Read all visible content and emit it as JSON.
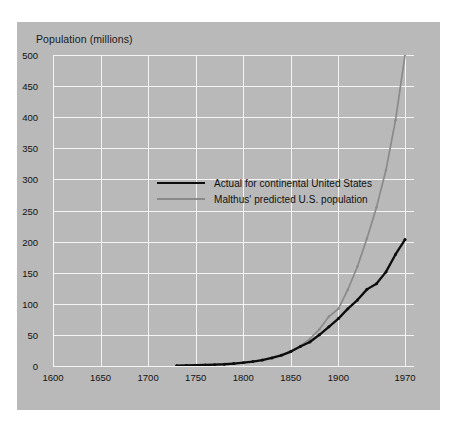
{
  "figure": {
    "y_axis_title": "Population (millions)",
    "background_color": "#b9b9b9",
    "grid_color": "#f4f4f4"
  },
  "legend": {
    "position": "inside-top-left",
    "entries": [
      {
        "label": "Actual for continental United States",
        "color": "#0d0d0d",
        "key": "actual"
      },
      {
        "label": "Malthus' predicted U.S. population",
        "color": "#8a8a8a",
        "key": "malthus"
      }
    ]
  },
  "axes": {
    "y_ticks": [
      "500",
      "450",
      "400",
      "350",
      "300",
      "250",
      "200",
      "150",
      "100",
      "50",
      "0"
    ],
    "x_ticks": [
      "1600",
      "1650",
      "1700",
      "1750",
      "1800",
      "1850",
      "1900",
      "1970"
    ]
  },
  "chart_data": {
    "type": "line",
    "title": "",
    "xlabel": "",
    "ylabel": "Population (millions)",
    "xlim": [
      1600,
      1970
    ],
    "ylim": [
      0,
      500
    ],
    "ytick_values": [
      0,
      50,
      100,
      150,
      200,
      250,
      300,
      350,
      400,
      450,
      500
    ],
    "xtick_values": [
      1600,
      1650,
      1700,
      1750,
      1800,
      1850,
      1900,
      1970
    ],
    "grid": true,
    "legend_position": "inside-top-left",
    "series": [
      {
        "name": "Actual for continental United States",
        "color": "#0d0d0d",
        "markers": true,
        "x": [
          1730,
          1740,
          1750,
          1760,
          1770,
          1780,
          1790,
          1800,
          1810,
          1820,
          1830,
          1840,
          1850,
          1860,
          1870,
          1880,
          1890,
          1900,
          1910,
          1920,
          1930,
          1940,
          1950,
          1960,
          1970
        ],
        "y": [
          0.6,
          0.9,
          1.2,
          1.6,
          2.1,
          2.8,
          3.9,
          5.3,
          7.2,
          9.6,
          12.9,
          17.1,
          23.2,
          31.4,
          38.6,
          50.2,
          63.0,
          76.2,
          92.2,
          106.0,
          123.2,
          132.2,
          151.3,
          179.3,
          203.2
        ]
      },
      {
        "name": "Malthus' predicted U.S. population",
        "color": "#8a8a8a",
        "markers": true,
        "x": [
          1730,
          1740,
          1750,
          1760,
          1770,
          1780,
          1790,
          1800,
          1810,
          1820,
          1830,
          1840,
          1850,
          1860,
          1870,
          1880,
          1890,
          1900,
          1910,
          1920,
          1930,
          1940,
          1950,
          1960,
          1970
        ],
        "y": [
          0.6,
          0.9,
          1.2,
          1.6,
          2.1,
          2.8,
          3.9,
          5.3,
          7.2,
          9.7,
          13.1,
          17.7,
          23.9,
          32.3,
          43.6,
          58.9,
          79.5,
          92.0,
          123.0,
          160.0,
          205.0,
          255.0,
          315.0,
          395.0,
          500.0
        ]
      }
    ]
  }
}
